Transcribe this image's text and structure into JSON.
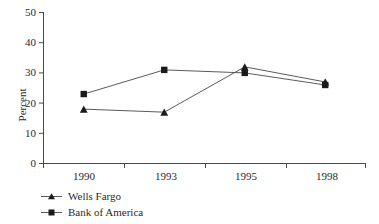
{
  "chart_data": {
    "type": "line",
    "title": "",
    "xlabel": "",
    "ylabel": "Percent",
    "categories": [
      "1990",
      "1993",
      "1995",
      "1998"
    ],
    "ylim": [
      0,
      50
    ],
    "yticks": [
      0,
      10,
      20,
      30,
      40,
      50
    ],
    "ytick_labels": [
      "0",
      "10",
      "20",
      "30",
      "40",
      "50"
    ],
    "grid": false,
    "legend_position": "below-left",
    "series": [
      {
        "name": "Wells Fargo",
        "marker": "triangle",
        "color": "#1a1a1a",
        "values": [
          18,
          17,
          32,
          27
        ]
      },
      {
        "name": "Bank of America",
        "marker": "square",
        "color": "#1a1a1a",
        "values": [
          23,
          31,
          30,
          26
        ]
      }
    ]
  },
  "axis": {
    "y_title": "Percent",
    "y_labels": [
      "50",
      "40",
      "30",
      "20",
      "10",
      "0"
    ],
    "x_labels": [
      "1990",
      "1993",
      "1995",
      "1998"
    ]
  },
  "legend": {
    "items": [
      {
        "label": "Wells Fargo",
        "marker": "triangle-marker"
      },
      {
        "label": "Bank of America",
        "marker": "square-marker"
      }
    ]
  }
}
